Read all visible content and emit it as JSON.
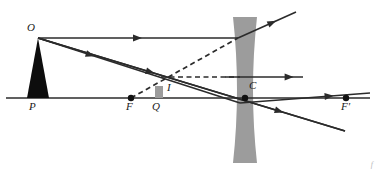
{
  "figure": {
    "type": "optics-ray-diagram",
    "width": 376,
    "height": 171,
    "background": "#ffffff"
  },
  "colors": {
    "ray": "#2b2b2b",
    "axis": "#2b2b2b",
    "lens_fill": "#9c9c9c",
    "object_fill": "#0d0d0d",
    "image_fill": "#9c9c9c",
    "dot": "#111111",
    "label": "#1a1a1a",
    "corner_mark": "#b9b9b9"
  },
  "axis": {
    "name": "principal-axis",
    "y": 98,
    "x_start": 6,
    "x_end": 370
  },
  "lens": {
    "name": "diverging-lens",
    "kind": "concave",
    "center_x": 245,
    "top_y": 17,
    "bottom_y": 163,
    "waist_half_width": 4,
    "edge_half_width": 12
  },
  "points": [
    {
      "key": "O",
      "label": "O",
      "x": 38,
      "y": 38,
      "label_x": 27,
      "label_y": 22,
      "dot": false,
      "desc": "object-tip"
    },
    {
      "key": "P",
      "label": "P",
      "x": 38,
      "y": 98,
      "label_x": 29,
      "label_y": 101,
      "dot": false,
      "desc": "object-base-on-axis"
    },
    {
      "key": "F",
      "label": "F",
      "x": 131,
      "y": 98,
      "label_x": 126,
      "label_y": 101,
      "dot": true,
      "desc": "near-focal-point"
    },
    {
      "key": "Q",
      "label": "Q",
      "x": 159,
      "y": 98,
      "label_x": 152,
      "label_y": 101,
      "dot": false,
      "desc": "image-base-on-axis"
    },
    {
      "key": "I",
      "label": "I",
      "x": 159,
      "y": 82,
      "label_x": 167,
      "label_y": 82,
      "dot": false,
      "desc": "image-tip"
    },
    {
      "key": "C",
      "label": "C",
      "x": 245,
      "y": 98,
      "label_x": 249,
      "label_y": 80,
      "dot": true,
      "desc": "lens-optical-centre"
    },
    {
      "key": "Fp",
      "label": "F'",
      "x": 346,
      "y": 98,
      "label_x": 341,
      "label_y": 101,
      "dot": true,
      "desc": "far-focal-point"
    }
  ],
  "object": {
    "name": "object-arrow",
    "tip_x": 38,
    "tip_y": 38,
    "base_x": 38,
    "base_y": 98,
    "base_half_width": 11,
    "fill": "#0d0d0d"
  },
  "image": {
    "name": "image-arrow",
    "tip_x": 159,
    "tip_y": 86,
    "base_x": 159,
    "base_y": 98,
    "base_half_width": 4,
    "fill": "#9c9c9c"
  },
  "rays": [
    {
      "name": "ray-parallel-incident",
      "style": "solid",
      "arrow_at": 0.52,
      "points": [
        [
          38,
          38
        ],
        [
          238,
          38
        ]
      ],
      "desc": "parallel ray from object tip to lens"
    },
    {
      "name": "ray-parallel-refracted",
      "style": "solid",
      "arrow_at": 0.66,
      "points": [
        [
          238,
          38
        ],
        [
          296,
          12
        ]
      ],
      "desc": "refracted diverging ray travelling up-right"
    },
    {
      "name": "ray-parallel-virtual-backward",
      "style": "dashed",
      "arrow_at": null,
      "points": [
        [
          131,
          98
        ],
        [
          238,
          38
        ]
      ],
      "desc": "virtual backward extension through near focus F"
    },
    {
      "name": "ray-through-centre",
      "style": "solid",
      "arrow_at": 0.38,
      "points": [
        [
          38,
          38
        ],
        [
          345,
          131
        ]
      ],
      "desc": "undeviated ray through optical centre C"
    },
    {
      "name": "ray-through-centre-arrow2",
      "style": "solid",
      "arrow_at": 0.8,
      "points": [
        [
          38,
          38
        ],
        [
          345,
          131
        ]
      ],
      "desc": "second arrowhead on centre ray"
    },
    {
      "name": "ray-toward-far-focus-incident",
      "style": "solid",
      "arrow_at": 0.28,
      "points": [
        [
          38,
          38
        ],
        [
          240,
          103
        ]
      ],
      "desc": "ray aimed at far focus F' hitting lens"
    },
    {
      "name": "ray-toward-far-focus-refracted",
      "style": "solid",
      "arrow_at": 0.72,
      "points": [
        [
          240,
          103
        ],
        [
          370,
          93
        ]
      ],
      "desc": "refracted ray emerging parallel-ish toward F'"
    },
    {
      "name": "ray-image-horizontal",
      "style": "solid",
      "arrow_at": 0.88,
      "points": [
        [
          225,
          77
        ],
        [
          303,
          77
        ]
      ],
      "desc": "horizontal emergent ray right of lens"
    },
    {
      "name": "ray-image-horizontal-virtual",
      "style": "dashed",
      "arrow_at": null,
      "points": [
        [
          161,
          77
        ],
        [
          240,
          77
        ]
      ],
      "desc": "dashed horizontal virtual extension from image tip"
    }
  ],
  "corner_mark": "f"
}
